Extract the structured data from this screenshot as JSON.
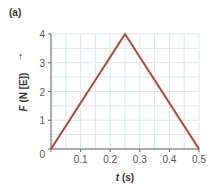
{
  "panel_label": "(a)",
  "chart_data": {
    "type": "line",
    "title": "",
    "xlabel": "t (s)",
    "ylabel": "F (N [E])",
    "x": [
      0,
      0.25,
      0.5
    ],
    "series": [
      {
        "name": "F",
        "values": [
          0,
          4,
          0
        ],
        "color": "#b5432f"
      }
    ],
    "xlim": [
      0,
      0.5
    ],
    "ylim": [
      0,
      4
    ],
    "xticks": [
      "0",
      "0.1",
      "0.2",
      "0.3",
      "0.4",
      "0.5"
    ],
    "yticks": [
      "0",
      "1",
      "2",
      "3",
      "4"
    ],
    "grid": true,
    "grid_minor_x_step": 0.05,
    "grid_minor_y_step": 0.5,
    "legend": "none"
  },
  "axis": {
    "x_label_var": "t",
    "x_label_unit": " (s)",
    "y_label_var": "F",
    "y_label_unit": " (N [E])"
  }
}
